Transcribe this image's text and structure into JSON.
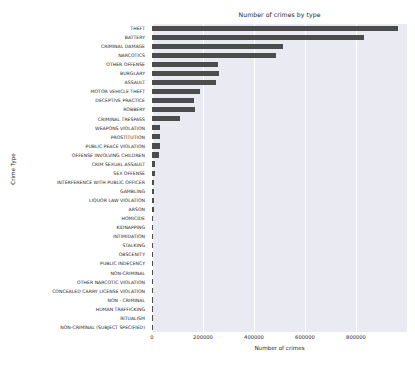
{
  "chart_data": {
    "type": "bar",
    "orientation": "horizontal",
    "title": "Number of crimes by type",
    "xlabel": "Number of crimes",
    "ylabel": "Crime Type",
    "xlim": [
      0,
      1000000
    ],
    "ylim_categories": 33,
    "grid": true,
    "grid_axis": "x",
    "legend": "none",
    "bar_color": "#4c4c4c",
    "plot_background": "#eaeaf2",
    "xticks": [
      "0",
      "200000",
      "400000",
      "600000",
      "800000"
    ],
    "xtick_values": [
      0,
      200000,
      400000,
      600000,
      800000
    ],
    "categories": [
      "THEFT",
      "BATTERY",
      "CRIMINAL DAMAGE",
      "NARCOTICS",
      "OTHER OFFENSE",
      "BURGLARY",
      "ASSAULT",
      "MOTOR VEHICLE THEFT",
      "DECEPTIVE PRACTICE",
      "ROBBERY",
      "CRIMINAL TRESPASS",
      "WEAPONS VIOLATION",
      "PROSTITUTION",
      "PUBLIC PEACE VIOLATION",
      "OFFENSE INVOLVING CHILDREN",
      "CRIM SEXUAL ASSAULT",
      "SEX OFFENSE",
      "INTERFERENCE WITH PUBLIC OFFICER",
      "GAMBLING",
      "LIQUOR LAW VIOLATION",
      "ARSON",
      "HOMICIDE",
      "KIDNAPPING",
      "INTIMIDATION",
      "STALKING",
      "OBSCENITY",
      "PUBLIC INDECENCY",
      "NON-CRIMINAL",
      "OTHER NARCOTIC VIOLATION",
      "CONCEALED CARRY LICENSE VIOLATION",
      "NON - CRIMINAL",
      "HUMAN TRAFFICKING",
      "RITUALISM",
      "NON-CRIMINAL (SUBJECT SPECIFIED)"
    ],
    "values": [
      966000,
      830000,
      515000,
      487000,
      259000,
      262000,
      252000,
      187000,
      163000,
      167000,
      111000,
      33000,
      32000,
      32000,
      27000,
      12500,
      12000,
      9500,
      9000,
      8500,
      6000,
      5500,
      3500,
      2500,
      2000,
      1000,
      800,
      500,
      400,
      300,
      200,
      120,
      60,
      30
    ]
  }
}
